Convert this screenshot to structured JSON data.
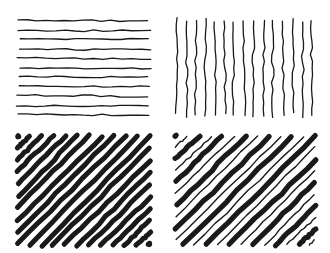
{
  "figure": {
    "width": 330,
    "height": 253,
    "background_color": "#ffffff",
    "ink_color": "#1a1a1a",
    "layout": "2x2 grid of untitled pattern panels, no axes, no labels, no legend"
  },
  "panels": [
    {
      "id": "top-left",
      "name": "horizontal-hatch-panel",
      "orientation": "horizontal",
      "line_count": 11,
      "stroke_width": 1.3,
      "stroke_color": "#1a1a1a",
      "style": "uniform thin wavy hand-drawn strokes, evenly spaced",
      "bounds": {
        "x": 18,
        "y": 20,
        "width": 132,
        "height": 95
      },
      "spacing": 9.5,
      "jitter": 1.1
    },
    {
      "id": "top-right",
      "name": "vertical-hatch-panel",
      "orientation": "vertical",
      "line_count": 15,
      "stroke_width": 1.3,
      "stroke_color": "#1a1a1a",
      "style": "uniform thin wavy hand-drawn strokes, evenly spaced",
      "bounds": {
        "x": 176,
        "y": 20,
        "width": 136,
        "height": 95
      },
      "spacing": 9.7,
      "jitter": 1.4
    },
    {
      "id": "bottom-left",
      "name": "diagonal-hatch-uniform-panel",
      "orientation": "diagonal-forward",
      "line_count": 12,
      "stroke_width": 5.0,
      "stroke_color": "#1a1a1a",
      "style": "uniform thick diagonal strokes at 45 degrees, bottom-left to top-right",
      "bounds": {
        "x": 18,
        "y": 136,
        "width": 132,
        "height": 109
      },
      "spacing": 11.8,
      "jitter": 0.9
    },
    {
      "id": "bottom-right",
      "name": "diagonal-hatch-alternating-panel",
      "orientation": "diagonal-forward",
      "line_count": 13,
      "stroke_width_thick": 5.2,
      "stroke_width_thin": 1.4,
      "stroke_color": "#1a1a1a",
      "style": "alternating thick and thin diagonal strokes at 45 degrees, bottom-left to top-right",
      "bounds": {
        "x": 176,
        "y": 136,
        "width": 139,
        "height": 109
      },
      "spacing": 11.0,
      "jitter": 1.0
    }
  ]
}
